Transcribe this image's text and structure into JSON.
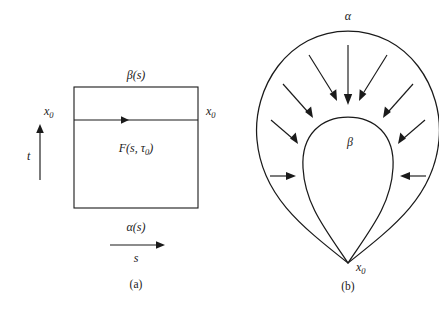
{
  "figure": {
    "panel_a": {
      "caption": "(a)",
      "top_label": "β(s)",
      "bottom_label": "α(s)",
      "interior_label_prefix": "F(s, τ",
      "interior_label_sub": "0",
      "interior_label_suffix": ")",
      "left_basepoint": "x",
      "left_basepoint_sub": "0",
      "right_basepoint": "x",
      "right_basepoint_sub": "0",
      "vertical_axis_label": "t",
      "horizontal_axis_label": "s",
      "square": {
        "x": 74,
        "y": 87,
        "width": 124,
        "height": 121
      },
      "divider_y": 120
    },
    "panel_b": {
      "caption": "(b)",
      "outer_label": "α",
      "inner_label": "β",
      "basepoint": "x",
      "basepoint_sub": "0",
      "arrow_count": 11,
      "description": "nested loops joined at basepoint with inward homotopy arrows"
    },
    "colors": {
      "ink": "#1a1a1a",
      "background": "#ffffff"
    }
  }
}
